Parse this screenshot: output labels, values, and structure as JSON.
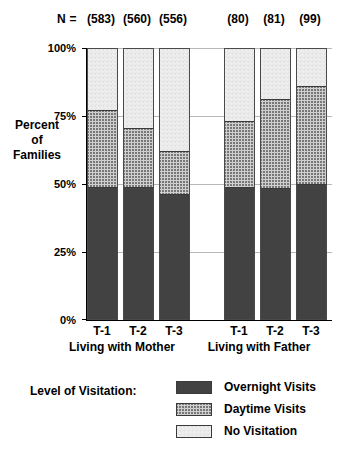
{
  "chart_data": {
    "type": "bar",
    "subtype": "stacked-percent",
    "title": "",
    "xlabel": "",
    "ylabel": "Percent of Families",
    "ylim": [
      0,
      100
    ],
    "ytick_labels": [
      "0%",
      "25%",
      "50%",
      "75%",
      "100%"
    ],
    "ytick_values": [
      0,
      25,
      50,
      75,
      100
    ],
    "grid": true,
    "legend_position": "bottom",
    "categories": [
      "T-1",
      "T-2",
      "T-3",
      "T-1",
      "T-2",
      "T-3"
    ],
    "groups": [
      {
        "label": "Living with Mother",
        "categories": [
          "T-1",
          "T-2",
          "T-3"
        ],
        "n": [
          "(583)",
          "(560)",
          "(556)"
        ]
      },
      {
        "label": "Living with Father",
        "categories": [
          "T-1",
          "T-2",
          "T-3"
        ],
        "n": [
          "(80)",
          "(81)",
          "(99)"
        ]
      }
    ],
    "series": [
      {
        "name": "Overnight Visits",
        "color": "#6e6e6e",
        "pattern": "dense-crosshatch",
        "values": [
          48.5,
          48.5,
          46.0,
          48.5,
          48.0,
          49.5
        ]
      },
      {
        "name": "Daytime Visits",
        "color": "#cfcfcf",
        "pattern": "crosshatch",
        "values": [
          28.5,
          22.0,
          16.0,
          24.5,
          33.0,
          36.5
        ]
      },
      {
        "name": "No Visitation",
        "color": "#ededed",
        "pattern": "light-stipple",
        "values": [
          23.0,
          29.5,
          38.0,
          27.0,
          19.0,
          14.0
        ]
      }
    ],
    "n_prefix": "N ="
  },
  "legend": {
    "title": "Level of Visitation:",
    "items": [
      {
        "label": "Overnight Visits"
      },
      {
        "label": "Daytime Visits"
      },
      {
        "label": "No Visitation"
      }
    ]
  }
}
